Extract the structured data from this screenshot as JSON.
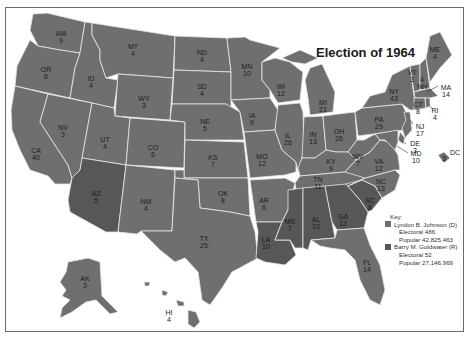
{
  "title": "Election of 1964",
  "colors": {
    "johnson": "#6f6f6f",
    "goldwater": "#575757",
    "border": "#e8e8e8",
    "frame": "#6a6a6a"
  },
  "key": {
    "heading": "Key:",
    "candidates": [
      {
        "name": "Lyndon B. Johnson (D)",
        "electoral": "Electoral 486",
        "popular": "Popular 42,825,463",
        "color": "#6f6f6f"
      },
      {
        "name": "Barry M. Goldwater (R)",
        "electoral": "Electoral 52",
        "popular": "Popular 27,146,969",
        "color": "#575757"
      }
    ]
  },
  "states": [
    {
      "abbr": "WA",
      "votes": "9",
      "winner": "johnson"
    },
    {
      "abbr": "OR",
      "votes": "6",
      "winner": "johnson"
    },
    {
      "abbr": "CA",
      "votes": "40",
      "winner": "johnson"
    },
    {
      "abbr": "ID",
      "votes": "4",
      "winner": "johnson"
    },
    {
      "abbr": "NV",
      "votes": "3",
      "winner": "johnson"
    },
    {
      "abbr": "MT",
      "votes": "4",
      "winner": "johnson"
    },
    {
      "abbr": "WY",
      "votes": "3",
      "winner": "johnson"
    },
    {
      "abbr": "UT",
      "votes": "4",
      "winner": "johnson"
    },
    {
      "abbr": "CO",
      "votes": "6",
      "winner": "johnson"
    },
    {
      "abbr": "AZ",
      "votes": "5",
      "winner": "goldwater"
    },
    {
      "abbr": "NM",
      "votes": "4",
      "winner": "johnson"
    },
    {
      "abbr": "ND",
      "votes": "4",
      "winner": "johnson"
    },
    {
      "abbr": "SD",
      "votes": "4",
      "winner": "johnson"
    },
    {
      "abbr": "NE",
      "votes": "5",
      "winner": "johnson"
    },
    {
      "abbr": "KS",
      "votes": "7",
      "winner": "johnson"
    },
    {
      "abbr": "OK",
      "votes": "8",
      "winner": "johnson"
    },
    {
      "abbr": "TX",
      "votes": "25",
      "winner": "johnson"
    },
    {
      "abbr": "MN",
      "votes": "10",
      "winner": "johnson"
    },
    {
      "abbr": "IA",
      "votes": "9",
      "winner": "johnson"
    },
    {
      "abbr": "MO",
      "votes": "12",
      "winner": "johnson"
    },
    {
      "abbr": "AR",
      "votes": "6",
      "winner": "johnson"
    },
    {
      "abbr": "LA",
      "votes": "10",
      "winner": "goldwater"
    },
    {
      "abbr": "WI",
      "votes": "12",
      "winner": "johnson"
    },
    {
      "abbr": "IL",
      "votes": "26",
      "winner": "johnson"
    },
    {
      "abbr": "MI",
      "votes": "21",
      "winner": "johnson"
    },
    {
      "abbr": "IN",
      "votes": "13",
      "winner": "johnson"
    },
    {
      "abbr": "OH",
      "votes": "26",
      "winner": "johnson"
    },
    {
      "abbr": "KY",
      "votes": "9",
      "winner": "johnson"
    },
    {
      "abbr": "TN",
      "votes": "11",
      "winner": "johnson"
    },
    {
      "abbr": "MS",
      "votes": "7",
      "winner": "goldwater"
    },
    {
      "abbr": "AL",
      "votes": "10",
      "winner": "goldwater"
    },
    {
      "abbr": "GA",
      "votes": "12",
      "winner": "goldwater"
    },
    {
      "abbr": "FL",
      "votes": "14",
      "winner": "johnson"
    },
    {
      "abbr": "SC",
      "votes": "8",
      "winner": "goldwater"
    },
    {
      "abbr": "NC",
      "votes": "13",
      "winner": "johnson"
    },
    {
      "abbr": "VA",
      "votes": "12",
      "winner": "johnson"
    },
    {
      "abbr": "WV",
      "votes": "7",
      "winner": "johnson"
    },
    {
      "abbr": "PA",
      "votes": "29",
      "winner": "johnson"
    },
    {
      "abbr": "NY",
      "votes": "43",
      "winner": "johnson"
    },
    {
      "abbr": "VT",
      "votes": "3",
      "winner": "johnson"
    },
    {
      "abbr": "NH",
      "votes": "4",
      "winner": "johnson"
    },
    {
      "abbr": "ME",
      "votes": "4",
      "winner": "johnson"
    },
    {
      "abbr": "MA",
      "votes": "14",
      "winner": "johnson"
    },
    {
      "abbr": "RI",
      "votes": "4",
      "winner": "johnson"
    },
    {
      "abbr": "CT",
      "votes": "8",
      "winner": "johnson"
    },
    {
      "abbr": "NJ",
      "votes": "17",
      "winner": "johnson"
    },
    {
      "abbr": "DE",
      "votes": "3",
      "winner": "johnson"
    },
    {
      "abbr": "MD",
      "votes": "10",
      "winner": "johnson"
    },
    {
      "abbr": "DC",
      "votes": "3",
      "winner": "johnson"
    },
    {
      "abbr": "AK",
      "votes": "3",
      "winner": "johnson"
    },
    {
      "abbr": "HI",
      "votes": "4",
      "winner": "johnson"
    }
  ]
}
